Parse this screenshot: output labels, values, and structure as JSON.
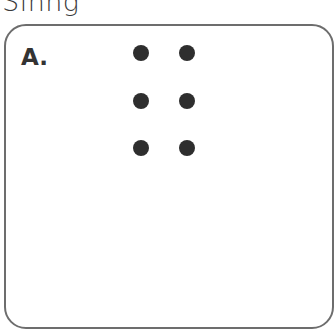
{
  "title": "Sinng",
  "card": {
    "label": "A.",
    "braille_cell": {
      "dots": [
        {
          "position": 1,
          "raised": true,
          "x": 141,
          "y": 53
        },
        {
          "position": 4,
          "raised": true,
          "x": 187,
          "y": 53
        },
        {
          "position": 2,
          "raised": true,
          "x": 141,
          "y": 101
        },
        {
          "position": 5,
          "raised": true,
          "x": 187,
          "y": 101
        },
        {
          "position": 3,
          "raised": true,
          "x": 141,
          "y": 148
        },
        {
          "position": 6,
          "raised": true,
          "x": 187,
          "y": 148
        }
      ]
    }
  },
  "colors": {
    "dot": "#2e2e2e",
    "border": "#6d6d6d",
    "text": "#333333"
  }
}
